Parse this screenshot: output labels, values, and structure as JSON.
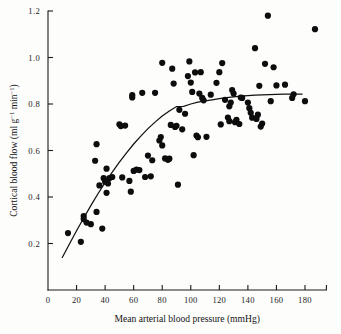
{
  "chart_data": {
    "type": "scatter",
    "title": "",
    "xlabel": "Mean arterial blood pressure (mmHg)",
    "ylabel": "Cortical blood flow (ml g⁻¹ min⁻¹)",
    "ylabel_parts": {
      "main": "Cortical blood flow (ml g",
      "sup1": "−1",
      "mid": " min",
      "sup2": "−1",
      "tail": ")"
    },
    "xlim": [
      0,
      195
    ],
    "ylim": [
      0,
      1.2
    ],
    "grid": false,
    "legend": null,
    "xticks": [
      0,
      20,
      40,
      60,
      80,
      100,
      120,
      140,
      160,
      180
    ],
    "xticklabels": [
      "0",
      "20",
      "40",
      "60",
      "80",
      "100",
      "120",
      "140",
      "160",
      "180"
    ],
    "yticks": [
      0.2,
      0.4,
      0.6,
      0.8,
      1.0,
      1.2
    ],
    "yticklabels": [
      "0.2",
      "0.4",
      "0.6",
      "0.8",
      "1.0",
      "1.2"
    ],
    "marker": "filled-circle",
    "marker_color": "#0d0d0d",
    "marker_size": 3.1,
    "curve_color": "#121212",
    "series": [
      {
        "name": "Cortical blood flow vs mean arterial blood pressure",
        "points": [
          [
            14,
            0.245
          ],
          [
            23,
            0.207
          ],
          [
            25,
            0.318
          ],
          [
            25,
            0.305
          ],
          [
            27,
            0.29
          ],
          [
            30,
            0.283
          ],
          [
            33,
            0.556
          ],
          [
            34,
            0.627
          ],
          [
            34,
            0.336
          ],
          [
            36,
            0.45
          ],
          [
            38,
            0.264
          ],
          [
            39,
            0.481
          ],
          [
            40,
            0.466
          ],
          [
            41,
            0.522
          ],
          [
            41,
            0.418
          ],
          [
            42,
            0.458
          ],
          [
            43,
            0.481
          ],
          [
            45,
            0.486
          ],
          [
            50,
            0.713
          ],
          [
            51,
            0.705
          ],
          [
            52,
            0.484
          ],
          [
            54,
            0.707
          ],
          [
            57,
            0.469
          ],
          [
            58,
            0.423
          ],
          [
            59,
            0.828
          ],
          [
            59,
            0.838
          ],
          [
            60,
            0.512
          ],
          [
            62,
            0.518
          ],
          [
            64,
            0.516
          ],
          [
            66,
            0.848
          ],
          [
            68,
            0.486
          ],
          [
            70,
            0.578
          ],
          [
            72,
            0.489
          ],
          [
            73,
            0.558
          ],
          [
            75,
            0.848
          ],
          [
            78,
            0.643
          ],
          [
            79,
            0.658
          ],
          [
            80,
            0.977
          ],
          [
            80,
            0.622
          ],
          [
            82,
            0.566
          ],
          [
            84,
            0.56
          ],
          [
            85,
            0.565
          ],
          [
            86,
            0.71
          ],
          [
            87,
            0.952
          ],
          [
            88,
            0.888
          ],
          [
            89,
            0.701
          ],
          [
            90,
            0.706
          ],
          [
            91,
            0.453
          ],
          [
            92,
            0.775
          ],
          [
            94,
            0.691
          ],
          [
            96,
            0.758
          ],
          [
            98,
            0.92
          ],
          [
            99,
            0.983
          ],
          [
            100,
            0.892
          ],
          [
            101,
            0.852
          ],
          [
            102,
            0.58
          ],
          [
            103,
            0.936
          ],
          [
            104,
            0.664
          ],
          [
            105,
            0.657
          ],
          [
            106,
            0.845
          ],
          [
            107,
            0.937
          ],
          [
            108,
            0.826
          ],
          [
            109,
            0.816
          ],
          [
            111,
            0.659
          ],
          [
            114,
            0.84
          ],
          [
            118,
            0.891
          ],
          [
            120,
            0.937
          ],
          [
            121,
            0.712
          ],
          [
            122,
            0.976
          ],
          [
            124,
            0.818
          ],
          [
            126,
            0.742
          ],
          [
            127,
            0.726
          ],
          [
            127,
            0.79
          ],
          [
            128,
            0.806
          ],
          [
            129,
            0.86
          ],
          [
            130,
            0.845
          ],
          [
            131,
            0.722
          ],
          [
            132,
            0.732
          ],
          [
            134,
            0.714
          ],
          [
            135,
            0.828
          ],
          [
            136,
            0.826
          ],
          [
            140,
            0.806
          ],
          [
            141,
            0.782
          ],
          [
            142,
            0.762
          ],
          [
            143,
            0.741
          ],
          [
            145,
            1.04
          ],
          [
            146,
            0.736
          ],
          [
            147,
            0.754
          ],
          [
            148,
            0.878
          ],
          [
            149,
            0.703
          ],
          [
            150,
            0.716
          ],
          [
            152,
            0.973
          ],
          [
            154,
            1.18
          ],
          [
            156,
            0.812
          ],
          [
            158,
            0.958
          ],
          [
            160,
            0.88
          ],
          [
            166,
            0.883
          ],
          [
            171,
            0.826
          ],
          [
            172,
            0.842
          ],
          [
            180,
            0.812
          ],
          [
            187,
            1.122
          ]
        ]
      }
    ],
    "fit_curve": {
      "name": "autoregulation fitted curve",
      "points": [
        [
          10,
          0.14
        ],
        [
          15,
          0.198
        ],
        [
          20,
          0.255
        ],
        [
          25,
          0.31
        ],
        [
          30,
          0.363
        ],
        [
          35,
          0.414
        ],
        [
          40,
          0.462
        ],
        [
          45,
          0.507
        ],
        [
          50,
          0.55
        ],
        [
          55,
          0.59
        ],
        [
          60,
          0.628
        ],
        [
          65,
          0.662
        ],
        [
          70,
          0.694
        ],
        [
          75,
          0.722
        ],
        [
          80,
          0.748
        ],
        [
          85,
          0.77
        ],
        [
          90,
          0.789
        ],
        [
          95,
          0.79
        ],
        [
          100,
          0.8
        ],
        [
          105,
          0.808
        ],
        [
          110,
          0.813
        ],
        [
          115,
          0.818
        ],
        [
          120,
          0.823
        ],
        [
          125,
          0.827
        ],
        [
          130,
          0.831
        ],
        [
          135,
          0.834
        ],
        [
          140,
          0.836
        ],
        [
          145,
          0.838
        ],
        [
          150,
          0.839
        ],
        [
          155,
          0.84
        ],
        [
          160,
          0.841
        ],
        [
          165,
          0.842
        ],
        [
          170,
          0.842
        ],
        [
          175,
          0.843
        ],
        [
          178,
          0.843
        ]
      ]
    }
  }
}
